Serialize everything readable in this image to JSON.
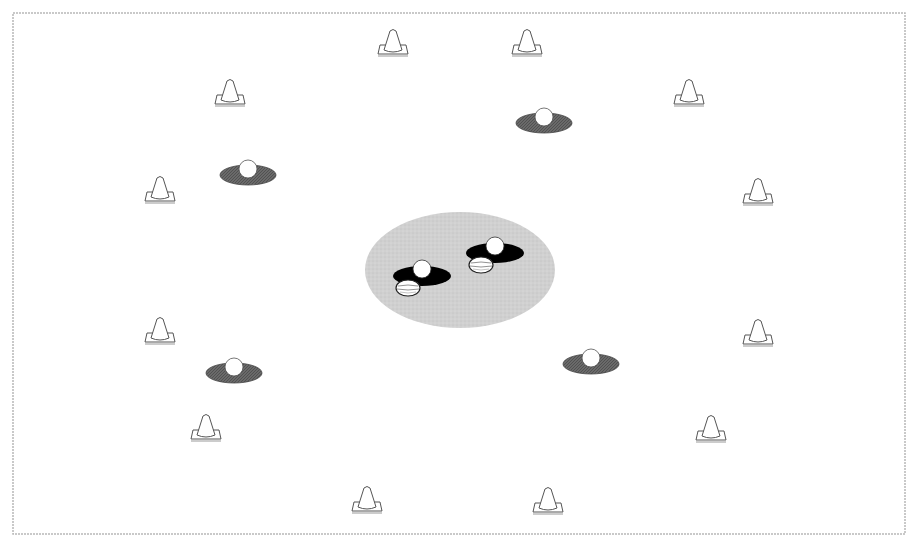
{
  "diagram": {
    "type": "drill-layout",
    "field": {
      "x": 13,
      "y": 13,
      "width": 892,
      "height": 521,
      "border_color": "#b8b8b8"
    },
    "center_zone": {
      "cx": 460,
      "cy": 270,
      "rx": 95,
      "ry": 58,
      "color": "#d0d0d0"
    },
    "colors": {
      "cone_stroke": "#555555",
      "disc_fill": "#6a6a6a",
      "player_fill": "#000000",
      "ball_fill": "#ffffff"
    },
    "cones": [
      {
        "x": 393,
        "y": 46
      },
      {
        "x": 527,
        "y": 46
      },
      {
        "x": 230,
        "y": 96
      },
      {
        "x": 689,
        "y": 96
      },
      {
        "x": 160,
        "y": 193
      },
      {
        "x": 758,
        "y": 195
      },
      {
        "x": 160,
        "y": 334
      },
      {
        "x": 758,
        "y": 336
      },
      {
        "x": 206,
        "y": 431
      },
      {
        "x": 711,
        "y": 432
      },
      {
        "x": 367,
        "y": 503
      },
      {
        "x": 548,
        "y": 504
      }
    ],
    "discs_with_ball": [
      {
        "x": 544,
        "y": 121
      },
      {
        "x": 248,
        "y": 173
      },
      {
        "x": 234,
        "y": 371
      },
      {
        "x": 591,
        "y": 362
      }
    ],
    "players_in_center": [
      {
        "x": 422,
        "y": 274,
        "rugby_ball": {
          "x": 408,
          "y": 288
        }
      },
      {
        "x": 495,
        "y": 251,
        "rugby_ball": {
          "x": 481,
          "y": 265
        }
      }
    ]
  }
}
